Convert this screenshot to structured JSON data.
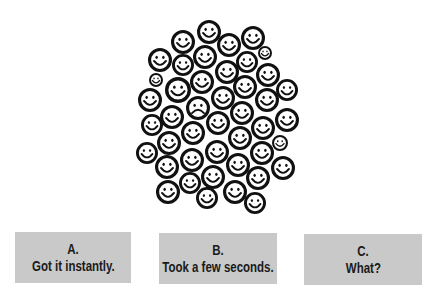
{
  "illustration": {
    "description": "crowd of smiley faces with one frowning face",
    "face_count": 44,
    "odd_face_index": 18,
    "faces": [
      {
        "x": 209,
        "y": 32,
        "r": 12,
        "mood": "smile"
      },
      {
        "x": 183,
        "y": 42,
        "r": 12,
        "mood": "smile"
      },
      {
        "x": 253,
        "y": 38,
        "r": 12,
        "mood": "smile"
      },
      {
        "x": 229,
        "y": 45,
        "r": 12,
        "mood": "smile"
      },
      {
        "x": 160,
        "y": 60,
        "r": 12,
        "mood": "smile"
      },
      {
        "x": 205,
        "y": 57,
        "r": 12,
        "mood": "smile"
      },
      {
        "x": 265,
        "y": 53,
        "r": 7,
        "mood": "smile"
      },
      {
        "x": 183,
        "y": 65,
        "r": 11,
        "mood": "smile"
      },
      {
        "x": 247,
        "y": 62,
        "r": 11,
        "mood": "smile"
      },
      {
        "x": 227,
        "y": 72,
        "r": 12,
        "mood": "smile"
      },
      {
        "x": 268,
        "y": 75,
        "r": 12,
        "mood": "smile"
      },
      {
        "x": 156,
        "y": 80,
        "r": 7,
        "mood": "smile"
      },
      {
        "x": 202,
        "y": 82,
        "r": 12,
        "mood": "smile"
      },
      {
        "x": 178,
        "y": 90,
        "r": 13,
        "mood": "smile"
      },
      {
        "x": 245,
        "y": 87,
        "r": 12,
        "mood": "smile"
      },
      {
        "x": 287,
        "y": 90,
        "r": 11,
        "mood": "smile"
      },
      {
        "x": 150,
        "y": 100,
        "r": 12,
        "mood": "smile"
      },
      {
        "x": 223,
        "y": 98,
        "r": 12,
        "mood": "smile"
      },
      {
        "x": 198,
        "y": 108,
        "r": 12,
        "mood": "frown"
      },
      {
        "x": 267,
        "y": 100,
        "r": 12,
        "mood": "smile"
      },
      {
        "x": 172,
        "y": 117,
        "r": 12,
        "mood": "smile"
      },
      {
        "x": 242,
        "y": 113,
        "r": 12,
        "mood": "smile"
      },
      {
        "x": 152,
        "y": 125,
        "r": 11,
        "mood": "smile"
      },
      {
        "x": 218,
        "y": 123,
        "r": 12,
        "mood": "smile"
      },
      {
        "x": 287,
        "y": 120,
        "r": 12,
        "mood": "smile"
      },
      {
        "x": 263,
        "y": 128,
        "r": 12,
        "mood": "smile"
      },
      {
        "x": 193,
        "y": 133,
        "r": 12,
        "mood": "smile"
      },
      {
        "x": 169,
        "y": 143,
        "r": 12,
        "mood": "smile"
      },
      {
        "x": 240,
        "y": 138,
        "r": 12,
        "mood": "smile"
      },
      {
        "x": 280,
        "y": 143,
        "r": 8,
        "mood": "smile"
      },
      {
        "x": 217,
        "y": 152,
        "r": 12,
        "mood": "smile"
      },
      {
        "x": 147,
        "y": 153,
        "r": 11,
        "mood": "smile"
      },
      {
        "x": 262,
        "y": 153,
        "r": 12,
        "mood": "smile"
      },
      {
        "x": 192,
        "y": 160,
        "r": 12,
        "mood": "smile"
      },
      {
        "x": 167,
        "y": 167,
        "r": 12,
        "mood": "smile"
      },
      {
        "x": 238,
        "y": 165,
        "r": 12,
        "mood": "smile"
      },
      {
        "x": 283,
        "y": 168,
        "r": 12,
        "mood": "smile"
      },
      {
        "x": 213,
        "y": 177,
        "r": 12,
        "mood": "smile"
      },
      {
        "x": 258,
        "y": 178,
        "r": 12,
        "mood": "smile"
      },
      {
        "x": 190,
        "y": 183,
        "r": 11,
        "mood": "smile"
      },
      {
        "x": 168,
        "y": 192,
        "r": 12,
        "mood": "smile"
      },
      {
        "x": 235,
        "y": 192,
        "r": 12,
        "mood": "smile"
      },
      {
        "x": 207,
        "y": 198,
        "r": 11,
        "mood": "smile"
      },
      {
        "x": 255,
        "y": 203,
        "r": 11,
        "mood": "smile"
      }
    ]
  },
  "options": [
    {
      "letter": "A.",
      "label": "Got it instantly."
    },
    {
      "letter": "B.",
      "label": "Took a few seconds."
    },
    {
      "letter": "C.",
      "label": "What?"
    }
  ],
  "colors": {
    "button_bg": "#c9c9c9",
    "button_text": "#1a1a1a",
    "face_stroke": "#111111",
    "face_fill": "#ffffff"
  }
}
